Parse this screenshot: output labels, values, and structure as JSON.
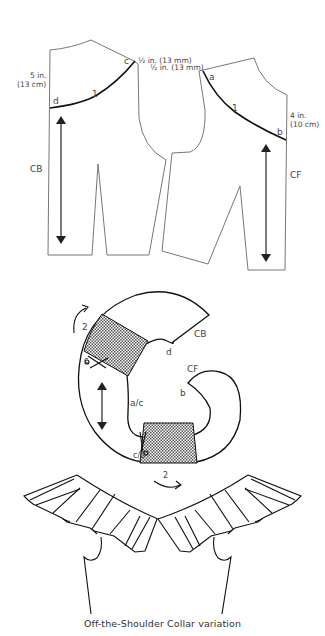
{
  "diagram": {
    "back_bodice": {
      "measure_label_line1": "5 in.",
      "measure_label_line2": "(13 cm)",
      "center_label": "CB",
      "point_start": "c",
      "point_end": "d",
      "seam_number": "1",
      "shoulder_note_line1": "½ in. (13 mm)"
    },
    "front_bodice": {
      "shoulder_note_line2": "½ in. (13 mm)",
      "measure_label_line1": "4 in.",
      "measure_label_line2": "(10 cm)",
      "center_label": "CF",
      "point_start": "a",
      "point_end": "b",
      "seam_number": "1"
    },
    "collar_piece": {
      "cb_label": "CB",
      "cf_label": "CF",
      "point_d": "d",
      "point_b": "b",
      "point_ac": "a/c",
      "slash_label_top": "c",
      "slash_label_bottom": "c/b",
      "rotation_step_top": "2",
      "rotation_step_bottom": "2"
    },
    "caption": "Off-the-Shoulder Collar variation"
  }
}
